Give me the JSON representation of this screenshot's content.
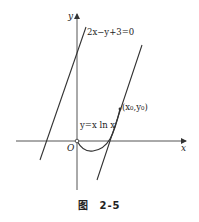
{
  "figure": {
    "caption_prefix": "图",
    "caption_number": "2-5"
  },
  "axes": {
    "x_label": "x",
    "y_label": "y",
    "origin_label": "O"
  },
  "labels": {
    "line_equation": "2x−y+3=0",
    "curve_equation": "y=x ln x",
    "tangent_point": "(x₀,y₀)"
  },
  "colors": {
    "stroke": "#333333",
    "axis": "#555555",
    "background": "#ffffff"
  }
}
